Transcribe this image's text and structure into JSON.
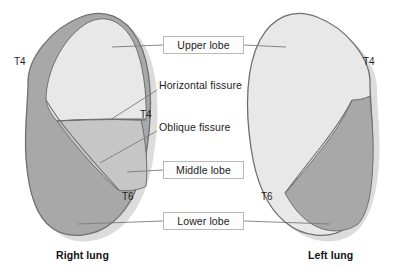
{
  "figure": {
    "background_color": "#ffffff"
  },
  "colors": {
    "upper_lobe_fill": "#e8e8e8",
    "middle_lobe_fill": "#c6c6c6",
    "lower_lobe_fill": "#a8a8a8",
    "outline": "#6f6f6f",
    "leader_line": "#7a7a7a",
    "box_border": "#b9b9b9",
    "box_fill": "#fdfdfd",
    "text": "#1b1b1b",
    "shadow": "#d8d8d8"
  },
  "callouts": [
    {
      "id": "upper-lobe",
      "label": "Upper lobe"
    },
    {
      "id": "middle-lobe",
      "label": "Middle lobe"
    },
    {
      "id": "lower-lobe",
      "label": "Lower lobe"
    }
  ],
  "fissure_labels": [
    {
      "id": "horizontal-fissure",
      "label": "Horizontal fissure"
    },
    {
      "id": "oblique-fissure",
      "label": "Oblique fissure"
    }
  ],
  "vertebral_levels": [
    {
      "id": "right-t4-apexlateral",
      "label": "T4"
    },
    {
      "id": "right-t4-fissure",
      "label": "T4"
    },
    {
      "id": "right-t6",
      "label": "T6"
    },
    {
      "id": "left-t4",
      "label": "T4"
    },
    {
      "id": "left-t6",
      "label": "T6"
    }
  ],
  "lungs": [
    {
      "id": "right-lung",
      "label": "Right lung",
      "lobes": [
        "Upper lobe",
        "Middle lobe",
        "Lower lobe"
      ]
    },
    {
      "id": "left-lung",
      "label": "Left lung",
      "lobes": [
        "Upper lobe",
        "Lower lobe"
      ]
    }
  ]
}
